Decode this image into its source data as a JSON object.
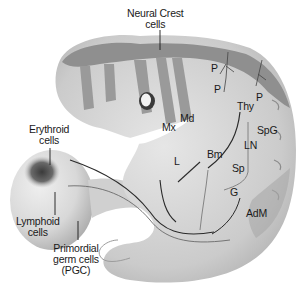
{
  "figure": {
    "colors": {
      "background": "#ffffff",
      "embryo_body": "#c4c4c4",
      "embryo_light": "#dedede",
      "neural_crest_band": "#8f8f8f",
      "yolk_sac": "#d9d9d9",
      "erythroid_cluster": "#4a4a4a",
      "lines": "#2a2a2a"
    }
  },
  "labels": {
    "neural_crest": [
      "Neural Crest",
      "cells"
    ],
    "erythroid": [
      "Erythroid",
      "cells"
    ],
    "lymphoid": [
      "Lymphoid",
      "cells"
    ],
    "pgc": [
      "Primordial",
      "germ cells",
      "(PGC)"
    ],
    "p1": "P",
    "p2": "P",
    "p3": "P",
    "mx": "Mx",
    "md": "Md",
    "thy": "Thy",
    "spg": "SpG",
    "ln": "LN",
    "bm": "Bm",
    "l": "L",
    "sp": "Sp",
    "g": "G",
    "adm": "AdM"
  }
}
